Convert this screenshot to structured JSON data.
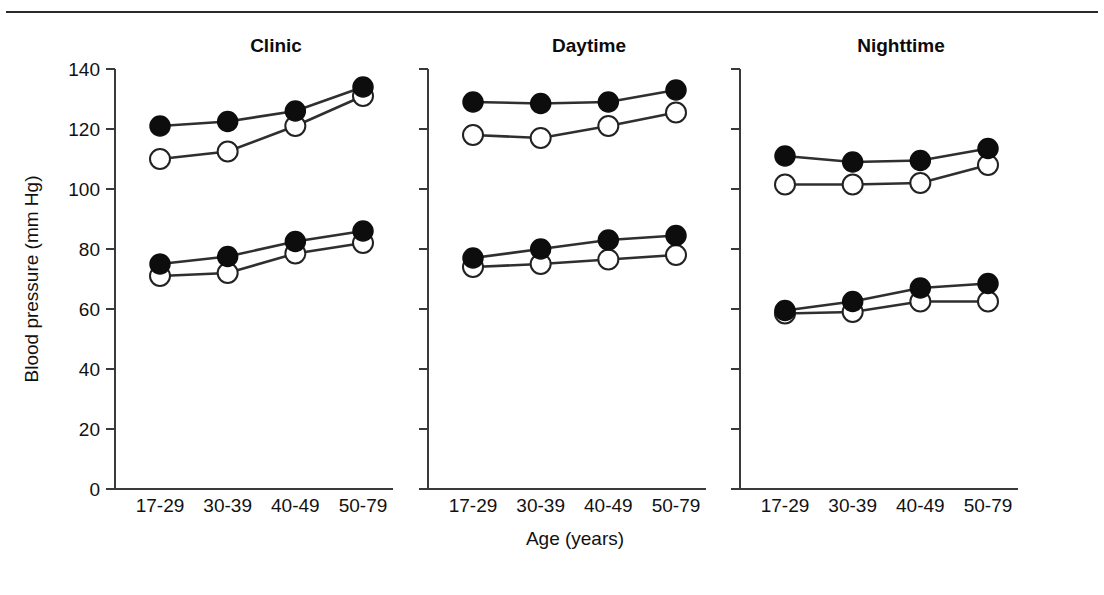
{
  "figure": {
    "top_rule": true,
    "background_color": "#ffffff",
    "line_color": "#2f2f2f",
    "marker_filled_color": "#0d0d0d",
    "marker_open_color": "#ffffff"
  },
  "chart_data": {
    "type": "line",
    "title": "",
    "xlabel": "Age (years)",
    "ylabel": "Blood pressure (mm Hg)",
    "categories": [
      "17-29",
      "30-39",
      "40-49",
      "50-79"
    ],
    "ylim": [
      0,
      140
    ],
    "yticks": [
      0,
      20,
      40,
      60,
      80,
      100,
      120,
      140
    ],
    "grid": false,
    "legend": "none",
    "panels": [
      {
        "name": "Clinic",
        "series": [
          {
            "name": "Men systolic",
            "marker": "filled",
            "values": [
              121,
              122.5,
              126,
              134
            ]
          },
          {
            "name": "Women systolic",
            "marker": "open",
            "values": [
              110,
              112.5,
              121,
              131
            ]
          },
          {
            "name": "Men diastolic",
            "marker": "filled",
            "values": [
              75,
              77.5,
              82.5,
              86
            ]
          },
          {
            "name": "Women diastolic",
            "marker": "open",
            "values": [
              71,
              72,
              78.5,
              82
            ]
          }
        ]
      },
      {
        "name": "Daytime",
        "series": [
          {
            "name": "Men systolic",
            "marker": "filled",
            "values": [
              129,
              128.5,
              129,
              133
            ]
          },
          {
            "name": "Women systolic",
            "marker": "open",
            "values": [
              118,
              117,
              121,
              125.5
            ]
          },
          {
            "name": "Men diastolic",
            "marker": "filled",
            "values": [
              77,
              80,
              83,
              84.5
            ]
          },
          {
            "name": "Women diastolic",
            "marker": "open",
            "values": [
              74,
              75,
              76.5,
              78
            ]
          }
        ]
      },
      {
        "name": "Nighttime",
        "series": [
          {
            "name": "Men systolic",
            "marker": "filled",
            "values": [
              111,
              109,
              109.5,
              113.5
            ]
          },
          {
            "name": "Women systolic",
            "marker": "open",
            "values": [
              101.5,
              101.5,
              102,
              108
            ]
          },
          {
            "name": "Men diastolic",
            "marker": "filled",
            "values": [
              59.5,
              62.5,
              67,
              68.5
            ]
          },
          {
            "name": "Women diastolic",
            "marker": "open",
            "values": [
              58.5,
              59,
              62.5,
              62.5
            ]
          }
        ]
      }
    ]
  }
}
